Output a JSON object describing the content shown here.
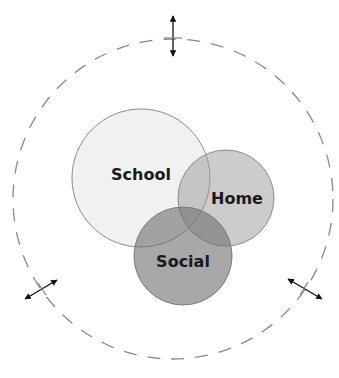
{
  "diagram": {
    "type": "venn",
    "outer_boundary": {
      "style": "dashed",
      "color": "#8a8a8a"
    },
    "sets": [
      {
        "label": "School",
        "fill": "#f0f0f0",
        "stroke": "#8c8c8c"
      },
      {
        "label": "Home",
        "fill": "#b8b8b8",
        "stroke": "#8c8c8c"
      },
      {
        "label": "Social",
        "fill": "#8e8e8e",
        "stroke": "#7a7a7a"
      }
    ],
    "arrows": [
      {
        "position": "top",
        "direction": "vertical",
        "icon": "double-arrow-icon"
      },
      {
        "position": "bottom-left",
        "direction": "diagonal",
        "icon": "double-arrow-icon"
      },
      {
        "position": "bottom-right",
        "direction": "diagonal",
        "icon": "double-arrow-icon"
      }
    ]
  }
}
